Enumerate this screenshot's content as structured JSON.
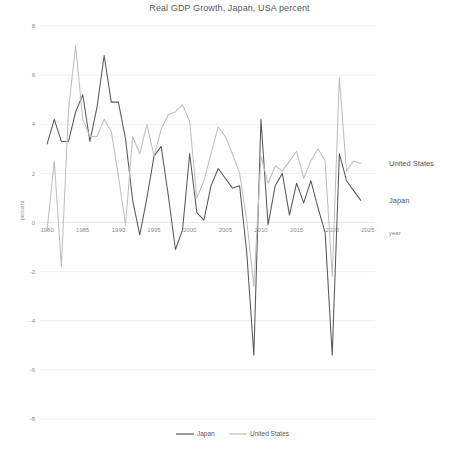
{
  "chart_data": {
    "type": "line",
    "title": "Real GDP Growth, Japan, USA percent",
    "xlabel": "year",
    "ylabel": "percent",
    "xlim": [
      1979,
      2026
    ],
    "ylim": [
      -8,
      8
    ],
    "grid": true,
    "legend_position": "bottom",
    "xticks": [
      "1980",
      "1985",
      "1990",
      "1995",
      "2000",
      "2005",
      "2010",
      "2015",
      "2020",
      "2025"
    ],
    "xtick_values": [
      1980,
      1985,
      1990,
      1995,
      2000,
      2005,
      2010,
      2015,
      2020,
      2025
    ],
    "yticks": [
      "8",
      "6",
      "4",
      "2",
      "0",
      "-2",
      "-4",
      "-6",
      "-8"
    ],
    "ytick_values": [
      8,
      6,
      4,
      2,
      0,
      -2,
      -4,
      -6,
      -8
    ],
    "x": [
      1980,
      1981,
      1982,
      1983,
      1984,
      1985,
      1986,
      1987,
      1988,
      1989,
      1990,
      1991,
      1992,
      1993,
      1994,
      1995,
      1996,
      1997,
      1998,
      1999,
      2000,
      2001,
      2002,
      2003,
      2004,
      2005,
      2006,
      2007,
      2008,
      2009,
      2010,
      2011,
      2012,
      2013,
      2014,
      2015,
      2016,
      2017,
      2018,
      2019,
      2020,
      2021,
      2022,
      2023,
      2024
    ],
    "series": [
      {
        "name": "Japan",
        "color": "#595959",
        "values": [
          3.2,
          4.2,
          3.3,
          3.3,
          4.5,
          5.2,
          3.3,
          4.7,
          6.8,
          4.9,
          4.9,
          3.4,
          0.9,
          -0.5,
          1.0,
          2.7,
          3.1,
          1.1,
          -1.1,
          -0.3,
          2.8,
          0.4,
          0.1,
          1.5,
          2.2,
          1.8,
          1.4,
          1.5,
          -1.2,
          -5.4,
          4.2,
          -0.1,
          1.5,
          2.0,
          0.3,
          1.6,
          0.8,
          1.7,
          0.6,
          -0.4,
          -5.4,
          2.8,
          1.7,
          1.3,
          0.9
        ]
      },
      {
        "name": "United States",
        "color": "#bfbfbf",
        "values": [
          -0.3,
          2.5,
          -1.8,
          4.6,
          7.2,
          4.2,
          3.5,
          3.5,
          4.2,
          3.7,
          1.9,
          -0.1,
          3.5,
          2.8,
          4.0,
          2.7,
          3.8,
          4.4,
          4.5,
          4.8,
          4.1,
          1.0,
          1.7,
          2.8,
          3.9,
          3.5,
          2.8,
          2.0,
          0.1,
          -2.6,
          2.7,
          1.6,
          2.3,
          2.1,
          2.5,
          2.9,
          1.8,
          2.5,
          3.0,
          2.5,
          -2.2,
          5.9,
          2.1,
          2.5,
          2.4
        ]
      }
    ],
    "series_end_labels": [
      {
        "name": "United States",
        "label": "United States"
      },
      {
        "name": "Japan",
        "label": "Japan"
      }
    ],
    "legend": [
      {
        "label": "Japan",
        "color": "#595959"
      },
      {
        "label": "United States",
        "color": "#bfbfbf"
      }
    ]
  }
}
